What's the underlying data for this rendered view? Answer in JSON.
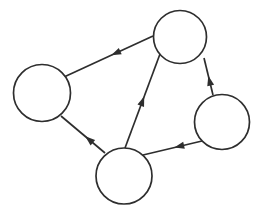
{
  "diagram": {
    "type": "directed-graph",
    "background_color": "#ffffff",
    "stroke_color": "#2e2e2e",
    "node_fill_color": "#ffffff",
    "stroke_width": 1.7,
    "canvas": {
      "width": 258,
      "height": 213
    },
    "nodes": [
      {
        "id": "node-top",
        "cx": 180,
        "cy": 37,
        "r": 26.5
      },
      {
        "id": "node-left",
        "cx": 42,
        "cy": 93,
        "r": 28.5
      },
      {
        "id": "node-right",
        "cx": 222,
        "cy": 122,
        "r": 27.5
      },
      {
        "id": "node-bottom",
        "cx": 124,
        "cy": 176,
        "r": 28
      }
    ],
    "edges": [
      {
        "id": "edge-top-to-left",
        "from": "node-top",
        "to": "node-left",
        "x1": 153,
        "y1": 36,
        "x2": 64,
        "y2": 77,
        "arrow_t": 0.47
      },
      {
        "id": "edge-bottom-to-top",
        "from": "node-bottom",
        "to": "node-top",
        "x1": 125,
        "y1": 148,
        "x2": 160,
        "y2": 54,
        "arrow_t": 0.55
      },
      {
        "id": "edge-right-to-top",
        "from": "node-right",
        "to": "node-top",
        "x1": 213,
        "y1": 95,
        "x2": 204,
        "y2": 58,
        "arrow_t": 0.52
      },
      {
        "id": "edge-right-to-bottom",
        "from": "node-right",
        "to": "node-bottom",
        "x1": 202,
        "y1": 141,
        "x2": 143,
        "y2": 155,
        "arrow_t": 0.47
      },
      {
        "id": "edge-bottom-to-left",
        "from": "node-bottom",
        "to": "node-left",
        "x1": 105,
        "y1": 153,
        "x2": 61,
        "y2": 116,
        "arrow_t": 0.45
      }
    ],
    "arrowhead": {
      "length": 10,
      "width": 7
    }
  }
}
